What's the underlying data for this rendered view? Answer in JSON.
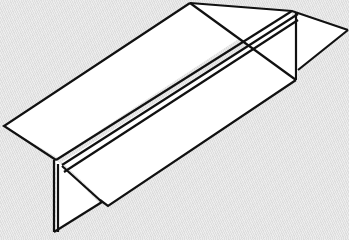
{
  "diagram": {
    "title": "",
    "colors": {
      "background": "#e6e6e6",
      "paper_fill": "#ffffff",
      "stroke": "#111111"
    },
    "stroke_width": 2.2,
    "faces": [
      {
        "name": "left-top-face",
        "points": "4,126 190,3 240,38 58,158"
      },
      {
        "name": "right-top-face",
        "points": "190,3 292,11 296,80 240,38"
      },
      {
        "name": "front-lower-face",
        "points": "62,162 298,13 298,80 108,206"
      },
      {
        "name": "right-triangle-flap",
        "points": "298,14 348,30 298,70"
      },
      {
        "name": "left-triangle-flap",
        "points": "56,160 56,232 100,204 62,165"
      }
    ],
    "lines": [
      {
        "name": "top-edge",
        "d": "M190,3 L292,11 L348,30"
      },
      {
        "name": "left-upper-edge",
        "d": "M190,3 L4,126 L56,160"
      },
      {
        "name": "ridge-line-a",
        "d": "M56,160 L292,11"
      },
      {
        "name": "ridge-line-b",
        "d": "M62,165 L298,14"
      },
      {
        "name": "ridge-line-c",
        "d": "M64,172 L298,20"
      },
      {
        "name": "diagonal-crease",
        "d": "M190,3 L296,80"
      },
      {
        "name": "right-vertical",
        "d": "M296,12 L296,80"
      },
      {
        "name": "right-flap-lower",
        "d": "M298,70 L348,30"
      },
      {
        "name": "front-bottom-edge",
        "d": "M296,80 L108,206 L100,200"
      },
      {
        "name": "left-vertical-a",
        "d": "M54,160 L54,232"
      },
      {
        "name": "left-vertical-b",
        "d": "M58,164 L58,232"
      },
      {
        "name": "left-flap-bottom",
        "d": "M54,232 L102,202"
      },
      {
        "name": "left-flap-diagonal",
        "d": "M62,166 L102,202"
      }
    ]
  }
}
